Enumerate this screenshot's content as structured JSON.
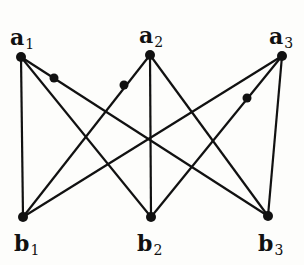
{
  "diagram": {
    "type": "bipartite-graph",
    "nodes": [
      {
        "id": "a1",
        "letter": "a",
        "index": "1",
        "x": 21,
        "y": 57,
        "label_x": 10,
        "label_y": 26
      },
      {
        "id": "a2",
        "letter": "a",
        "index": "2",
        "x": 150,
        "y": 55,
        "label_x": 139,
        "label_y": 24
      },
      {
        "id": "a3",
        "letter": "a",
        "index": "3",
        "x": 282,
        "y": 56,
        "label_x": 269,
        "label_y": 25
      },
      {
        "id": "b1",
        "letter": "b",
        "index": "1",
        "x": 23,
        "y": 217,
        "label_x": 14,
        "label_y": 232
      },
      {
        "id": "b2",
        "letter": "b",
        "index": "2",
        "x": 151,
        "y": 217,
        "label_x": 137,
        "label_y": 232
      },
      {
        "id": "b3",
        "letter": "b",
        "index": "3",
        "x": 268,
        "y": 216,
        "label_x": 258,
        "label_y": 232
      }
    ],
    "edges": [
      [
        "a1",
        "b1"
      ],
      [
        "a1",
        "b2"
      ],
      [
        "a1",
        "b3"
      ],
      [
        "a2",
        "b1"
      ],
      [
        "a2",
        "b2"
      ],
      [
        "a2",
        "b3"
      ],
      [
        "a3",
        "b1"
      ],
      [
        "a3",
        "b2"
      ],
      [
        "a3",
        "b3"
      ]
    ],
    "subdivision_points": [
      {
        "on_edge": [
          "a1",
          "b3"
        ],
        "x": 54,
        "y": 78
      },
      {
        "on_edge": [
          "a2",
          "b1"
        ],
        "x": 124,
        "y": 85
      },
      {
        "on_edge": [
          "a3",
          "b2"
        ],
        "x": 247,
        "y": 98
      }
    ],
    "colors": {
      "line": "#111111",
      "node": "#111111",
      "background": "#fdfdfb"
    }
  }
}
